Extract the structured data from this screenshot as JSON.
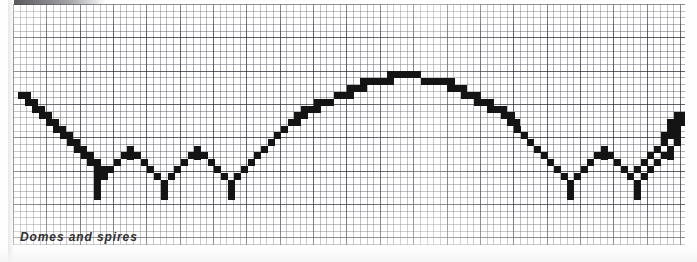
{
  "figure": {
    "caption": "Domes and spires",
    "title": "Domes and spires",
    "medium": "graph paper plot",
    "ink_color": "#141414",
    "grid_color": "#46464f",
    "paper_color": "#ffffff"
  },
  "chart_data": {
    "type": "line",
    "title": "Domes and spires",
    "subtitle": "",
    "xlabel": "",
    "ylabel": "",
    "grid": true,
    "legend": null,
    "x": [
      0,
      1,
      2,
      3,
      4,
      5,
      6,
      7,
      8,
      9,
      10,
      11,
      12,
      13,
      14,
      15,
      16,
      17,
      18,
      19,
      20,
      21,
      22,
      23,
      24,
      25,
      26,
      27,
      28,
      29,
      30,
      31,
      32,
      33,
      34,
      35,
      36,
      37,
      38,
      39,
      40
    ],
    "values": [
      62,
      56,
      50,
      44,
      38,
      32,
      26,
      20,
      14,
      8,
      22,
      36,
      22,
      8,
      22,
      36,
      22,
      8,
      26,
      44,
      62,
      80,
      94,
      104,
      110,
      112,
      110,
      104,
      94,
      80,
      62,
      44,
      26,
      8,
      22,
      36,
      22,
      8,
      22,
      36,
      62
    ],
    "xlim": [
      0,
      40
    ],
    "ylim": [
      0,
      120
    ],
    "features": [
      {
        "name": "left-descending-stair",
        "x_range": [
          0,
          9
        ]
      },
      {
        "name": "spire-1",
        "x": 11
      },
      {
        "name": "spire-2",
        "x": 15
      },
      {
        "name": "central-dome-apex",
        "x": 25
      },
      {
        "name": "spire-3",
        "x": 35
      },
      {
        "name": "spire-4",
        "x": 39
      },
      {
        "name": "right-ascending-stair",
        "x_range": [
          39,
          40
        ]
      }
    ]
  },
  "waveform_blocks": [
    [
      5,
      88,
      13,
      7
    ],
    [
      12,
      95,
      13,
      7
    ],
    [
      19,
      102,
      13,
      7
    ],
    [
      26,
      108,
      13,
      7
    ],
    [
      33,
      115,
      13,
      7
    ],
    [
      40,
      122,
      13,
      7
    ],
    [
      47,
      128,
      13,
      7
    ],
    [
      54,
      135,
      13,
      7
    ],
    [
      61,
      142,
      13,
      7
    ],
    [
      68,
      148,
      13,
      7
    ],
    [
      74,
      155,
      14,
      7
    ],
    [
      81,
      162,
      14,
      7
    ],
    [
      81,
      169,
      7,
      7
    ],
    [
      81,
      176,
      7,
      7
    ],
    [
      81,
      182,
      7,
      14
    ],
    [
      88,
      169,
      7,
      7
    ],
    [
      94,
      162,
      7,
      7
    ],
    [
      101,
      155,
      7,
      7
    ],
    [
      108,
      148,
      7,
      7
    ],
    [
      114,
      142,
      7,
      14
    ],
    [
      121,
      148,
      7,
      7
    ],
    [
      128,
      155,
      7,
      7
    ],
    [
      134,
      162,
      7,
      7
    ],
    [
      141,
      169,
      7,
      7
    ],
    [
      148,
      176,
      7,
      7
    ],
    [
      148,
      182,
      7,
      14
    ],
    [
      155,
      169,
      7,
      7
    ],
    [
      161,
      162,
      7,
      7
    ],
    [
      168,
      155,
      7,
      7
    ],
    [
      175,
      148,
      7,
      7
    ],
    [
      181,
      142,
      7,
      14
    ],
    [
      188,
      148,
      7,
      7
    ],
    [
      195,
      155,
      7,
      7
    ],
    [
      201,
      162,
      7,
      7
    ],
    [
      208,
      169,
      7,
      7
    ],
    [
      215,
      176,
      7,
      7
    ],
    [
      215,
      182,
      7,
      14
    ],
    [
      221,
      169,
      7,
      7
    ],
    [
      228,
      162,
      7,
      7
    ],
    [
      235,
      155,
      7,
      7
    ],
    [
      241,
      148,
      7,
      7
    ],
    [
      248,
      142,
      7,
      7
    ],
    [
      255,
      135,
      7,
      7
    ],
    [
      261,
      128,
      7,
      7
    ],
    [
      268,
      122,
      7,
      7
    ],
    [
      275,
      115,
      13,
      7
    ],
    [
      281,
      108,
      14,
      7
    ],
    [
      288,
      102,
      20,
      7
    ],
    [
      301,
      95,
      20,
      7
    ],
    [
      321,
      88,
      20,
      7
    ],
    [
      334,
      81,
      20,
      7
    ],
    [
      347,
      74,
      34,
      7
    ],
    [
      374,
      67,
      34,
      7
    ],
    [
      408,
      74,
      34,
      7
    ],
    [
      434,
      81,
      20,
      7
    ],
    [
      448,
      88,
      20,
      7
    ],
    [
      461,
      95,
      20,
      7
    ],
    [
      474,
      102,
      20,
      7
    ],
    [
      488,
      108,
      14,
      7
    ],
    [
      494,
      115,
      13,
      7
    ],
    [
      501,
      122,
      7,
      7
    ],
    [
      508,
      128,
      7,
      7
    ],
    [
      514,
      135,
      7,
      7
    ],
    [
      521,
      142,
      7,
      7
    ],
    [
      528,
      148,
      7,
      7
    ],
    [
      534,
      155,
      7,
      7
    ],
    [
      541,
      162,
      7,
      7
    ],
    [
      548,
      169,
      7,
      7
    ],
    [
      554,
      176,
      7,
      7
    ],
    [
      554,
      182,
      7,
      14
    ],
    [
      561,
      169,
      7,
      7
    ],
    [
      568,
      162,
      7,
      7
    ],
    [
      574,
      155,
      7,
      7
    ],
    [
      581,
      148,
      7,
      7
    ],
    [
      588,
      142,
      7,
      14
    ],
    [
      594,
      148,
      7,
      7
    ],
    [
      601,
      155,
      7,
      7
    ],
    [
      608,
      162,
      7,
      7
    ],
    [
      614,
      169,
      7,
      7
    ],
    [
      621,
      176,
      7,
      7
    ],
    [
      621,
      182,
      7,
      14
    ],
    [
      628,
      169,
      7,
      7
    ],
    [
      634,
      162,
      7,
      7
    ],
    [
      641,
      155,
      7,
      7
    ],
    [
      648,
      148,
      7,
      7
    ],
    [
      654,
      142,
      7,
      14
    ],
    [
      661,
      135,
      7,
      7
    ],
    [
      661,
      128,
      7,
      7
    ],
    [
      654,
      128,
      7,
      7
    ],
    [
      648,
      135,
      7,
      7
    ],
    [
      648,
      128,
      14,
      7
    ],
    [
      654,
      122,
      14,
      7
    ],
    [
      661,
      115,
      13,
      7
    ],
    [
      661,
      108,
      13,
      7
    ],
    [
      654,
      115,
      7,
      7
    ],
    [
      641,
      142,
      7,
      7
    ],
    [
      634,
      148,
      7,
      7
    ],
    [
      628,
      155,
      7,
      7
    ],
    [
      621,
      162,
      7,
      7
    ],
    [
      614,
      169,
      7,
      7
    ]
  ]
}
